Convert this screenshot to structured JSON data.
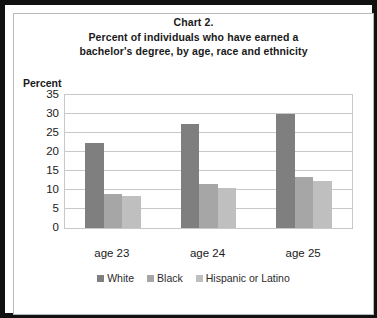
{
  "chart_data": {
    "type": "bar",
    "title": "Chart 2. Percent of individuals who have earned a bachelor's degree, by age, race and ethnicity",
    "title_lines": [
      "Chart 2.",
      "Percent of individuals who have earned a",
      "bachelor's degree, by age, race and ethnicity"
    ],
    "categories": [
      "age 23",
      "age 24",
      "age 25"
    ],
    "series": [
      {
        "name": "White",
        "values": [
          22.5,
          27.5,
          30.0
        ],
        "color": "#7f7f7f"
      },
      {
        "name": "Black",
        "values": [
          9.0,
          11.5,
          13.5
        ],
        "color": "#a6a6a6"
      },
      {
        "name": "Hispanic or Latino",
        "values": [
          8.5,
          10.5,
          12.5
        ],
        "color": "#bfbfbf"
      }
    ],
    "xlabel": "",
    "ylabel": "Percent",
    "ylim": [
      0,
      35
    ],
    "ytick_step": 5,
    "yticks": [
      35,
      30,
      25,
      20,
      15,
      10,
      5,
      0
    ],
    "grid": true,
    "legend_position": "bottom",
    "gridline_color": "#c8c8c8",
    "plot_border_color": "#c8c8c8",
    "frame_color": "#111111",
    "inner_frame_color": "#b9b9b9",
    "text_color": "#1a1a1a"
  }
}
